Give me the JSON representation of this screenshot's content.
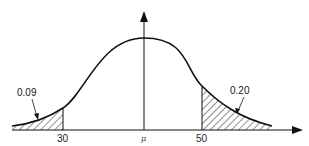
{
  "diagram": {
    "type": "normal-distribution",
    "x_axis_ticks": [
      {
        "label": "30"
      },
      {
        "label": "μ"
      },
      {
        "label": "50"
      }
    ],
    "annotations": [
      {
        "label": "0.09",
        "region": "left-tail",
        "description": "area below 30"
      },
      {
        "label": "0.20",
        "region": "right-tail",
        "description": "area above 50"
      }
    ],
    "colors": {
      "line": "#111111",
      "background": "#ffffff"
    }
  }
}
